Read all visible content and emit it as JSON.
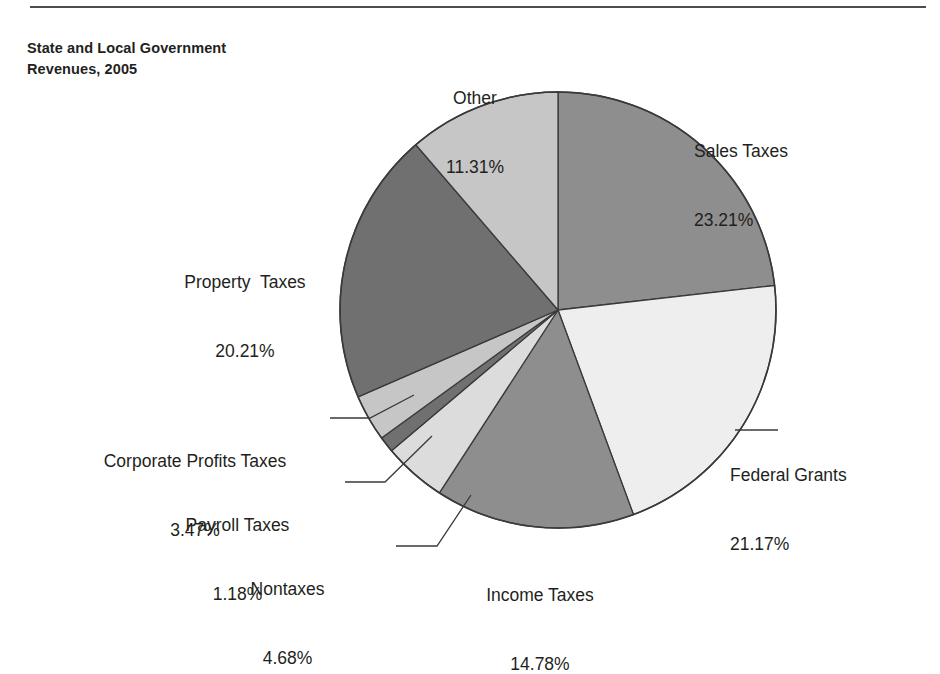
{
  "figure": {
    "title_line1": "State and Local Government",
    "title_line2": "Revenues, 2005",
    "rule_color": "#4c4c4c",
    "background": "#ffffff",
    "text_color": "#231f20",
    "outline_color": "#3a3a3a"
  },
  "chart_data": {
    "type": "pie",
    "title": "State and Local Government Revenues, 2005",
    "xlabel": "",
    "ylabel": "",
    "units": "percent of total revenues",
    "start_angle_deg": 0,
    "direction": "clockwise",
    "legend": "none (direct labels with leader lines)",
    "grid": false,
    "categories": [
      "Sales Taxes",
      "Federal Grants",
      "Income Taxes",
      "Nontaxes",
      "Payroll Taxes",
      "Corporate Profits Taxes",
      "Property  Taxes",
      "Other"
    ],
    "values": [
      23.21,
      21.17,
      14.78,
      4.68,
      1.18,
      3.47,
      20.21,
      11.31
    ],
    "value_labels": [
      "23.21%",
      "21.17%",
      "14.78%",
      "4.68%",
      "1.18%",
      "3.47%",
      "20.21%",
      "11.31%"
    ],
    "colors": [
      "#8e8e8e",
      "#eeeeee",
      "#8e8e8e",
      "#dcdcdc",
      "#707070",
      "#c6c6c6",
      "#707070",
      "#c6c6c6"
    ],
    "total": 100.01
  },
  "slices": [
    {
      "key": "sales",
      "name": "Sales Taxes",
      "pct": "23.21%",
      "color": "#8e8e8e"
    },
    {
      "key": "federal",
      "name": "Federal Grants",
      "pct": "21.17%",
      "color": "#eeeeee"
    },
    {
      "key": "income",
      "name": "Income Taxes",
      "pct": "14.78%",
      "color": "#8e8e8e"
    },
    {
      "key": "nontaxes",
      "name": "Nontaxes",
      "pct": "4.68%",
      "color": "#dcdcdc"
    },
    {
      "key": "payroll",
      "name": "Payroll Taxes",
      "pct": "1.18%",
      "color": "#707070"
    },
    {
      "key": "corporate",
      "name": "Corporate Profits Taxes",
      "pct": "3.47%",
      "color": "#c6c6c6"
    },
    {
      "key": "property",
      "name": "Property  Taxes",
      "pct": "20.21%",
      "color": "#707070"
    },
    {
      "key": "other",
      "name": "Other",
      "pct": "11.31%",
      "color": "#c6c6c6"
    }
  ]
}
